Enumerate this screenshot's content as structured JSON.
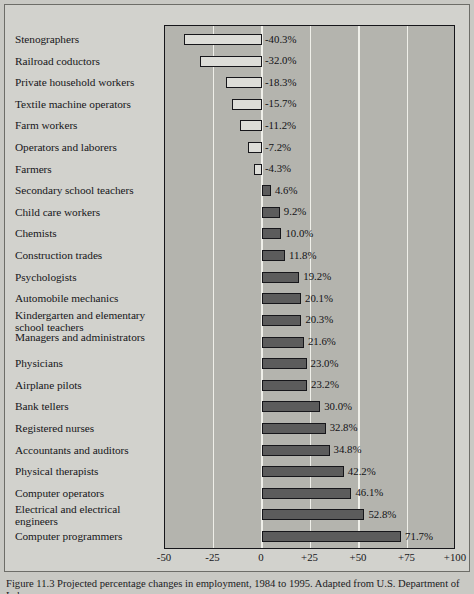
{
  "figure": {
    "caption": "Figure 11.3 Projected percentage changes in employment, 1984 to 1995. Adapted from U.S. Department of Labor."
  },
  "chart_data": {
    "type": "bar",
    "orientation": "horizontal",
    "title": "",
    "xlabel": "",
    "ylabel": "",
    "xlim": [
      -50,
      100
    ],
    "grid": true,
    "gridlines": [
      -50,
      -25,
      0,
      25,
      50,
      75,
      100
    ],
    "tick_labels": [
      "-50",
      "-25",
      "0",
      "+25",
      "+50",
      "+75",
      "+100"
    ],
    "categories": [
      "Stenographers",
      "Railroad coductors",
      "Private household workers",
      "Textile machine operators",
      "Farm workers",
      "Operators and laborers",
      "Farmers",
      "Secondary school teachers",
      "Child care workers",
      "Chemists",
      "Construction trades",
      "Psychologists",
      "Automobile mechanics",
      "Kindergarten and elementary school teachers",
      "Managers and administrators",
      "Physicians",
      "Airplane pilots",
      "Bank tellers",
      "Registered nurses",
      "Accountants and auditors",
      "Physical therapists",
      "Computer operators",
      "Electrical and electrical engineers",
      "Computer programmers"
    ],
    "values": [
      -40.3,
      -32.0,
      -18.3,
      -15.7,
      -11.2,
      -7.2,
      -4.3,
      4.6,
      9.2,
      10.0,
      11.8,
      19.2,
      20.1,
      20.3,
      21.6,
      23.0,
      23.2,
      30.0,
      32.8,
      34.8,
      42.2,
      46.1,
      52.8,
      71.7
    ],
    "value_labels": [
      "-40.3%",
      "-32.0%",
      "-18.3%",
      "-15.7%",
      "-11.2%",
      "-7.2%",
      "-4.3%",
      "4.6%",
      "9.2%",
      "10.0%",
      "11.8%",
      "19.2%",
      "20.1%",
      "20.3%",
      "21.6%",
      "23.0%",
      "23.2%",
      "30.0%",
      "32.8%",
      "34.8%",
      "42.2%",
      "46.1%",
      "52.8%",
      "71.7%"
    ],
    "colors": {
      "negative_fill": "#ddddd8",
      "positive_fill": "#5c5c5c",
      "bar_outline": "#16161a",
      "panel_background": "#b4b4ae",
      "gridline": "#efefe9",
      "page_background": "#d2d2cd"
    }
  }
}
